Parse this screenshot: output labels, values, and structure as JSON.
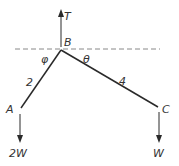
{
  "diagram": {
    "colors": {
      "line": "#2a2a2a",
      "dash": "#888888",
      "text": "#333333"
    },
    "labels": {
      "tension": "T",
      "apex": "B",
      "left_end": "A",
      "right_end": "C",
      "left_angle": "φ",
      "right_angle": "θ",
      "left_length": "2",
      "right_length": "4",
      "left_weight": "2W",
      "right_weight": "W"
    },
    "points": {
      "B": [
        61,
        50
      ],
      "A": [
        21,
        108
      ],
      "C": [
        158,
        107
      ]
    }
  }
}
